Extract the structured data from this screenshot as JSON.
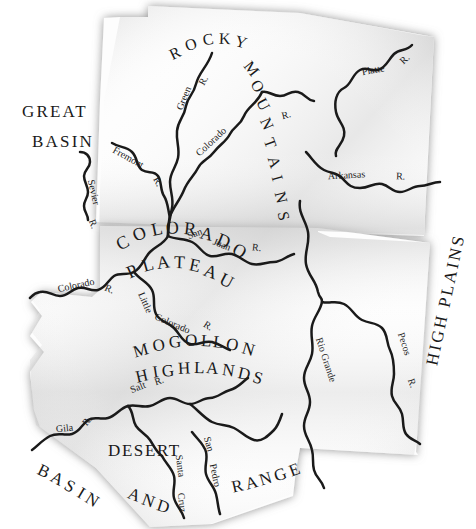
{
  "map": {
    "title": "Physiographic Provinces of the Four Corners Region",
    "background_color": "#ffffff",
    "land_fill": "#fefefe",
    "shadow_color": "#9a9a9a",
    "river_color": "#1a1a1a",
    "label_color": "#1a1a1a",
    "regions": [
      {
        "id": "great-basin",
        "line1": "GREAT",
        "line2": "BASIN",
        "font_size": 17,
        "x": 58,
        "y": 113,
        "x2": 42,
        "y2": 145,
        "rotate": 0,
        "style": "straight"
      },
      {
        "id": "rocky-mountains",
        "line1": "ROCKY",
        "line2": "MOUNTAINS",
        "font_size": 16,
        "x": 0,
        "y": 0,
        "rotate": 0,
        "style": "arc"
      },
      {
        "id": "colorado-plateau",
        "line1": "COLORADO",
        "line2": "PLATEAU",
        "font_size": 18,
        "x": 0,
        "y": 0,
        "rotate": 0,
        "style": "arc"
      },
      {
        "id": "mogollon-highlands",
        "line1": "MOGOLLON",
        "line2": "HIGHLANDS",
        "font_size": 17,
        "x": 0,
        "y": 0,
        "rotate": 0,
        "style": "arc"
      },
      {
        "id": "high-plains",
        "line1": "HIGH PLAINS",
        "line2": "",
        "font_size": 17,
        "x": 0,
        "y": 0,
        "rotate": -78,
        "style": "rotated"
      },
      {
        "id": "desert",
        "line1": "DESERT",
        "line2": "",
        "font_size": 17,
        "x": 110,
        "y": 449,
        "rotate": 0,
        "style": "straight"
      },
      {
        "id": "basin-and-range",
        "line1": "BASIN",
        "line2": "AND",
        "line3": "RANGE",
        "font_size": 17,
        "x": 0,
        "y": 0,
        "rotate": 0,
        "style": "arc"
      }
    ],
    "rivers": [
      {
        "id": "green-river",
        "label": "Green",
        "suffix": "R."
      },
      {
        "id": "colorado-river-up",
        "label": "Colorado",
        "suffix": ""
      },
      {
        "id": "platte-river",
        "label": "Platte",
        "suffix": "R."
      },
      {
        "id": "arkansas-river",
        "label": "Arkansas",
        "suffix": "R."
      },
      {
        "id": "fremont-river",
        "label": "Fremont",
        "suffix": "R."
      },
      {
        "id": "sevier-river",
        "label": "Sevier",
        "suffix": "R."
      },
      {
        "id": "san-juan-river",
        "label": "San Juan",
        "suffix": "R."
      },
      {
        "id": "colorado-river-low",
        "label": "Colorado",
        "suffix": "R."
      },
      {
        "id": "little-colorado",
        "label": "Little",
        "label2": "Colorado",
        "suffix": "R."
      },
      {
        "id": "rio-grande",
        "label": "Rio Grande",
        "suffix": ""
      },
      {
        "id": "pecos-river",
        "label": "Pecos",
        "suffix": "R."
      },
      {
        "id": "salt-river",
        "label": "Salt",
        "suffix": "R."
      },
      {
        "id": "gila-river",
        "label": "Gila",
        "suffix": "R."
      },
      {
        "id": "santa-cruz-river",
        "label": "Santa Cruz",
        "suffix": ""
      },
      {
        "id": "san-pedro-river",
        "label": "San Pedro",
        "suffix": ""
      },
      {
        "id": "mountain-trib",
        "label": "",
        "suffix": "R."
      }
    ],
    "river_label_texts": {
      "green": "Green",
      "green_r": "R.",
      "colorado_upper": "Colorado",
      "platte": "Platte",
      "platte_r": "R.",
      "arkansas": "Arkansas",
      "arkansas_r": "R.",
      "mountain_trib_r": "R.",
      "fremont": "Fremont",
      "fremont_r": "R.",
      "sevier": "Sevier",
      "sevier_r": "R.",
      "san": "San",
      "juan": "Juan",
      "sanjuan_r": "R.",
      "colorado_lower": "Colorado",
      "colorado_lower_r": "R.",
      "little": "Little",
      "little_colorado": "Colorado",
      "little_colorado_r": "R.",
      "rio_grande": "Rio Grande",
      "pecos": "Pecos",
      "pecos_r": "R.",
      "salt": "Salt",
      "salt_r": "R.",
      "gila": "Gila",
      "gila_r": "R.",
      "santa": "Santa",
      "cruz": "Cruz",
      "san_pedro_a": "San",
      "san_pedro_b": "Pedro"
    },
    "region_label_texts": {
      "great": "GREAT",
      "basin_gb": "BASIN",
      "rocky": "ROCKY",
      "mountains": "MOUNTAINS",
      "colorado_plateau_1": "COLORADO",
      "colorado_plateau_2": "PLATEAU",
      "mogollon": "MOGOLLON",
      "highlands": "HIGHLANDS",
      "high_plains": "HIGH PLAINS",
      "desert": "DESERT",
      "basin_br": "BASIN",
      "and_br": "AND",
      "range_br": "RANGE"
    }
  }
}
